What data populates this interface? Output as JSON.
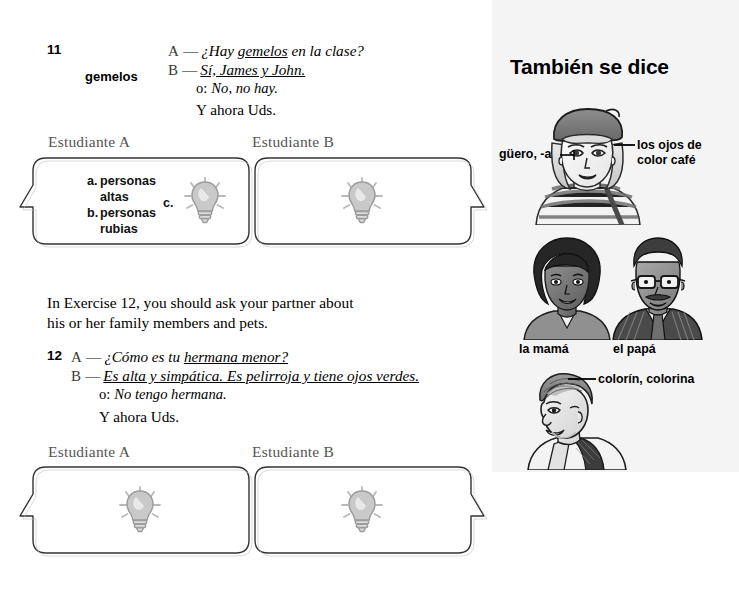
{
  "page": {
    "background": "#ffffff",
    "sidebar_background": "#f4f4f4"
  },
  "exercise_11": {
    "number": "11",
    "cue_word": "gemelos",
    "lines": [
      {
        "speaker": "A",
        "dash": "—",
        "text": "¿Hay gemelos en la clase?",
        "style": "italic",
        "underline": "gemelos"
      },
      {
        "speaker": "B",
        "dash": "—",
        "text": "Sí, James y John.",
        "style": "italic-underline"
      }
    ],
    "alt_prefix": "o:",
    "alt_text": "No, no hay.",
    "y_ahora": "Y ahora Uds.",
    "student_a_label": "Estudiante A",
    "student_b_label": "Estudiante B",
    "options": [
      {
        "letter": "a.",
        "line1": "personas",
        "line2": "altas"
      },
      {
        "letter": "b.",
        "line1": "personas",
        "line2": "rubias"
      }
    ],
    "option_c_letter": "c.",
    "bulb_icon_a": "lightbulb-icon",
    "bulb_icon_b": "lightbulb-icon"
  },
  "intro_12": {
    "line1": "In Exercise 12, you should ask your partner about",
    "line2": "his or her family members and pets."
  },
  "exercise_12": {
    "number": "12",
    "lines": [
      {
        "speaker": "A",
        "dash": "—",
        "text": "¿Cómo es tu hermana menor?",
        "underline": "hermana menor?"
      },
      {
        "speaker": "B",
        "dash": "—",
        "text": "Es alta y simpática. Es pelirroja y tiene ojos verdes."
      }
    ],
    "alt_prefix": "o:",
    "alt_text": "No tengo hermana.",
    "y_ahora": "Y ahora Uds.",
    "student_a_label": "Estudiante A",
    "student_b_label": "Estudiante B",
    "bulb_icon_a": "lightbulb-icon",
    "bulb_icon_b": "lightbulb-icon"
  },
  "sidebar": {
    "title": "También se dice",
    "illustrations": [
      {
        "name": "woman-with-beret",
        "labels": [
          {
            "text": "güero, -a",
            "position": "left"
          },
          {
            "text": "los ojos de",
            "position": "right-line1"
          },
          {
            "text": "color café",
            "position": "right-line2"
          }
        ]
      },
      {
        "name": "parents-couple",
        "labels": [
          {
            "text": "la mamá",
            "position": "below-left"
          },
          {
            "text": "el papá",
            "position": "below-right"
          }
        ]
      },
      {
        "name": "young-man",
        "labels": [
          {
            "text": "colorín, colorina",
            "position": "right"
          }
        ]
      }
    ]
  }
}
